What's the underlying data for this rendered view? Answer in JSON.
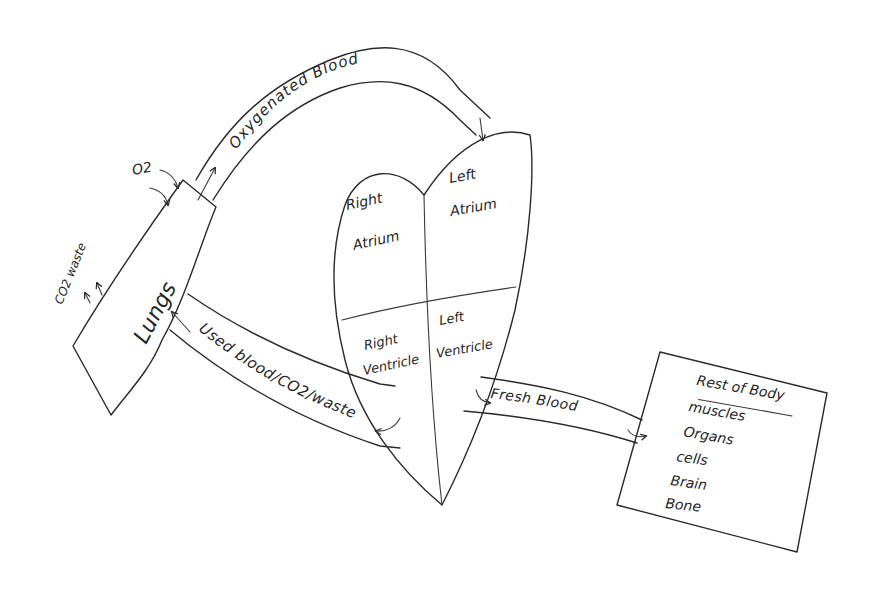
{
  "diagram": {
    "ink_color": "#2a2a2a",
    "background": "#ffffff",
    "nodes": {
      "lungs": {
        "label": "Lungs"
      },
      "heart": {
        "right_atrium": {
          "line1": "Right",
          "line2": "Atrium"
        },
        "left_atrium": {
          "line1": "Left",
          "line2": "Atrium"
        },
        "right_ventricle": {
          "line1": "Right",
          "line2": "Ventricle"
        },
        "left_ventricle": {
          "line1": "Left",
          "line2": "Ventricle"
        }
      },
      "rest_of_body": {
        "title": "Rest of Body",
        "items": [
          "muscles",
          "Organs",
          "cells",
          "Brain",
          "Bone"
        ]
      }
    },
    "labels": {
      "o2": "O2",
      "co2_waste": "CO2 waste"
    },
    "edges": {
      "oxygenated": {
        "label": "Oxygenated Blood",
        "from": "Lungs",
        "to": "Left Atrium"
      },
      "used": {
        "label": "Used blood/CO2/waste",
        "from": "Right Ventricle",
        "to": "Lungs"
      },
      "fresh": {
        "label": "Fresh Blood",
        "from": "Left Ventricle",
        "to": "Rest of Body"
      }
    }
  }
}
